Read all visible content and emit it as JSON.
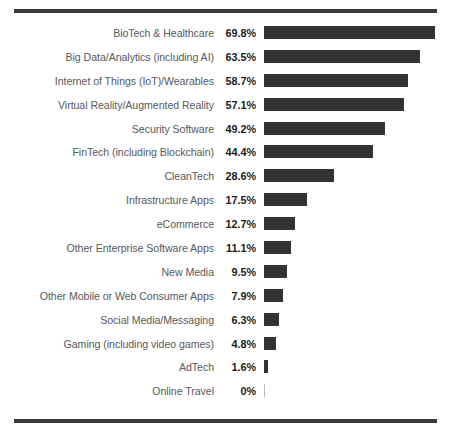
{
  "chart_data": {
    "type": "bar",
    "orientation": "horizontal",
    "title": "",
    "subtitle": "",
    "xlabel": "",
    "ylabel": "",
    "grid": false,
    "legend": null,
    "xlim": [
      0,
      69.8
    ],
    "value_suffix": "%",
    "bar_color": "#333333",
    "label_color": "#58595b",
    "value_color": "#1b1b1b",
    "rule_color": "#3a3a3a",
    "categories": [
      "BioTech & Healthcare",
      "Big Data/Analytics (including AI)",
      "Internet of Things (IoT)/Wearables",
      "Virtual Reality/Augmented Reality",
      "Security Software",
      "FinTech (including Blockchain)",
      "CleanTech",
      "Infrastructure Apps",
      "eCommerce",
      "Other Enterprise Software Apps",
      "New Media",
      "Other Mobile or Web Consumer Apps",
      "Social Media/Messaging",
      "Gaming (including video games)",
      "AdTech",
      "Online Travel"
    ],
    "values": [
      69.8,
      63.5,
      58.7,
      57.1,
      49.2,
      44.4,
      28.6,
      17.5,
      12.7,
      11.1,
      9.5,
      7.9,
      6.3,
      4.8,
      1.6,
      0
    ],
    "value_labels": [
      "69.8%",
      "63.5%",
      "58.7%",
      "57.1%",
      "49.2%",
      "44.4%",
      "28.6%",
      "17.5%",
      "12.7%",
      "11.1%",
      "9.5%",
      "7.9%",
      "6.3%",
      "4.8%",
      "1.6%",
      "0%"
    ]
  },
  "rows": [
    {
      "label": "BioTech & Healthcare",
      "value_label": "69.8%",
      "value": 69.8
    },
    {
      "label": "Big Data/Analytics (including AI)",
      "value_label": "63.5%",
      "value": 63.5
    },
    {
      "label": "Internet of Things (IoT)/Wearables",
      "value_label": "58.7%",
      "value": 58.7
    },
    {
      "label": "Virtual Reality/Augmented Reality",
      "value_label": "57.1%",
      "value": 57.1
    },
    {
      "label": "Security Software",
      "value_label": "49.2%",
      "value": 49.2
    },
    {
      "label": "FinTech (including Blockchain)",
      "value_label": "44.4%",
      "value": 44.4
    },
    {
      "label": "CleanTech",
      "value_label": "28.6%",
      "value": 28.6
    },
    {
      "label": "Infrastructure Apps",
      "value_label": "17.5%",
      "value": 17.5
    },
    {
      "label": "eCommerce",
      "value_label": "12.7%",
      "value": 12.7
    },
    {
      "label": "Other Enterprise Software Apps",
      "value_label": "11.1%",
      "value": 11.1
    },
    {
      "label": "New Media",
      "value_label": "9.5%",
      "value": 9.5
    },
    {
      "label": "Other Mobile or Web Consumer Apps",
      "value_label": "7.9%",
      "value": 7.9
    },
    {
      "label": "Social Media/Messaging",
      "value_label": "6.3%",
      "value": 6.3
    },
    {
      "label": "Gaming (including video games)",
      "value_label": "4.8%",
      "value": 4.8
    },
    {
      "label": "AdTech",
      "value_label": "1.6%",
      "value": 1.6
    },
    {
      "label": "Online Travel",
      "value_label": "0%",
      "value": 0
    }
  ],
  "scale": {
    "px_per_unit": 2.452,
    "bar_origin_x": 264
  }
}
